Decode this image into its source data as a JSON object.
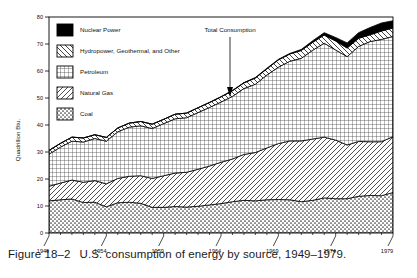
{
  "figure": {
    "label": "Figure 18–2",
    "caption": "U.S. consumption of energy by source, 1949–1979."
  },
  "axes": {
    "ylabel": "Quadrillion Btu.",
    "yticks": [
      "0",
      "10",
      "20",
      "30",
      "40",
      "50",
      "60",
      "70",
      "80"
    ],
    "ylim": [
      0,
      80
    ],
    "xticks": [
      "1949",
      "1954",
      "1959",
      "1964",
      "1969",
      "1974",
      "1979"
    ],
    "xlim": [
      1949,
      1979
    ],
    "grid": false
  },
  "annotation": {
    "text": "Total Consumption",
    "at_year": 1964
  },
  "legend": {
    "position": "upper-left-inside",
    "items": [
      {
        "label": "Nuclear Power",
        "pattern": "solid-black",
        "color": "#000000"
      },
      {
        "label": "Hydropower, Geothermal, and Other",
        "pattern": "diagonal-backslash",
        "color": "#000000"
      },
      {
        "label": "Petroleum",
        "pattern": "grid-cross",
        "color": "#000000"
      },
      {
        "label": "Natural Gas",
        "pattern": "diagonal-slash",
        "color": "#000000"
      },
      {
        "label": "Coal",
        "pattern": "stipple-dots",
        "color": "#000000"
      }
    ]
  },
  "chart_data": {
    "type": "area",
    "stacked": true,
    "title": "U.S. consumption of energy by source, 1949–1979.",
    "xlabel": "",
    "ylabel": "Quadrillion Btu.",
    "ylim": [
      0,
      80
    ],
    "xlim": [
      1949,
      1979
    ],
    "x": [
      1949,
      1950,
      1951,
      1952,
      1953,
      1954,
      1955,
      1956,
      1957,
      1958,
      1959,
      1960,
      1961,
      1962,
      1963,
      1964,
      1965,
      1966,
      1967,
      1968,
      1969,
      1970,
      1971,
      1972,
      1973,
      1974,
      1975,
      1976,
      1977,
      1978,
      1979
    ],
    "series": [
      {
        "name": "Coal",
        "pattern": "stipple-dots",
        "values": [
          11.9,
          12.3,
          12.6,
          11.3,
          11.4,
          9.7,
          11.2,
          11.4,
          11.0,
          9.5,
          9.5,
          9.8,
          9.6,
          9.9,
          10.4,
          10.9,
          11.6,
          12.1,
          11.9,
          12.3,
          12.4,
          12.3,
          11.6,
          12.1,
          13.0,
          12.7,
          12.7,
          13.6,
          13.9,
          13.8,
          15.0
        ]
      },
      {
        "name": "Natural Gas",
        "pattern": "diagonal-slash",
        "values": [
          5.4,
          6.2,
          7.0,
          7.5,
          8.0,
          8.5,
          9.0,
          9.6,
          10.2,
          10.7,
          11.7,
          12.4,
          12.9,
          13.7,
          14.4,
          15.3,
          15.8,
          17.0,
          17.9,
          19.2,
          20.7,
          21.8,
          22.5,
          22.7,
          22.5,
          21.7,
          19.9,
          20.3,
          19.9,
          20.0,
          20.7
        ]
      },
      {
        "name": "Petroleum",
        "pattern": "grid-cross",
        "values": [
          11.9,
          13.3,
          14.4,
          14.9,
          15.6,
          15.8,
          17.3,
          18.2,
          18.5,
          18.5,
          19.3,
          20.1,
          20.2,
          21.0,
          21.7,
          22.3,
          23.2,
          24.4,
          25.3,
          27.0,
          28.3,
          29.5,
          30.6,
          32.9,
          34.8,
          33.4,
          32.7,
          35.2,
          37.1,
          37.9,
          37.1
        ]
      },
      {
        "name": "Hydropower, Geothermal, and Other",
        "pattern": "diagonal-backslash",
        "values": [
          1.4,
          1.4,
          1.5,
          1.5,
          1.4,
          1.4,
          1.4,
          1.5,
          1.6,
          1.6,
          1.6,
          1.7,
          1.7,
          1.8,
          1.8,
          1.9,
          2.1,
          2.1,
          2.3,
          2.3,
          2.7,
          2.7,
          2.9,
          2.9,
          3.0,
          3.3,
          3.2,
          3.0,
          2.5,
          3.1,
          3.1
        ]
      },
      {
        "name": "Nuclear Power",
        "pattern": "solid-black",
        "values": [
          0,
          0,
          0,
          0,
          0,
          0,
          0,
          0,
          0,
          0,
          0,
          0,
          0,
          0,
          0.1,
          0.1,
          0.1,
          0.1,
          0.2,
          0.2,
          0.2,
          0.2,
          0.4,
          0.6,
          0.9,
          1.3,
          1.9,
          2.1,
          2.7,
          3.0,
          2.7
        ]
      }
    ],
    "total_label": "Total Consumption"
  }
}
